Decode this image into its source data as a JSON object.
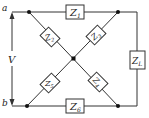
{
  "terminals": {
    "a": "a",
    "b": "b"
  },
  "source": {
    "label": "V"
  },
  "impedances": [
    {
      "id": "Z1",
      "main": "Z",
      "sub": "1",
      "position": "top branch"
    },
    {
      "id": "Z2",
      "main": "Z",
      "sub": "2",
      "position": "upper-left diagonal"
    },
    {
      "id": "Z3",
      "main": "Z",
      "sub": "3",
      "position": "upper-right diagonal"
    },
    {
      "id": "Z4",
      "main": "Z",
      "sub": "4",
      "position": "lower-right diagonal"
    },
    {
      "id": "Z5",
      "main": "Z",
      "sub": "5",
      "position": "lower-left diagonal"
    },
    {
      "id": "Z6",
      "main": "Z",
      "sub": "6",
      "position": "bottom branch"
    },
    {
      "id": "ZL",
      "main": "Z",
      "sub": "L",
      "position": "right load branch"
    }
  ],
  "colors": {
    "wire": "#333333",
    "background": "#ffffff"
  }
}
